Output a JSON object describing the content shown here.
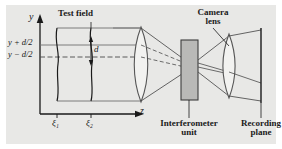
{
  "figure": {
    "kind": "optical-setup-diagram",
    "background_color": "#ffffff",
    "panel_color": "#e8e8e6",
    "ink_color": "#1a1a1a"
  },
  "axes": {
    "y_label": "y",
    "z_label": "z",
    "y_axis_arrow": "up",
    "z_axis_arrow": "right"
  },
  "labels": {
    "test_field": "Test field",
    "camera_lens_line1": "Camera",
    "camera_lens_line2": "lens",
    "interferometer_line1": "Interferometer",
    "interferometer_line2": "unit",
    "recording_line1": "Recording",
    "recording_line2": "plane",
    "y_plus": "y + d/2",
    "y_minus": "y − d/2",
    "separation": "d",
    "xi1": "ξ₁",
    "xi2": "ξ₂"
  },
  "components": [
    {
      "name": "test-field-wavefront-1",
      "type": "wavy-line",
      "z": "ξ₁"
    },
    {
      "name": "test-field-wavefront-2",
      "type": "wavy-line",
      "z": "ξ₂"
    },
    {
      "name": "objective-lens",
      "type": "lens"
    },
    {
      "name": "interferometer-unit",
      "type": "block"
    },
    {
      "name": "camera-lens",
      "type": "lens"
    },
    {
      "name": "recording-plane",
      "type": "plane"
    }
  ],
  "ray_paths": {
    "upper_ray": "solid",
    "lower_ray": "solid",
    "axial_ray": "dashed"
  },
  "colors": {
    "panel": "#e8e8e6",
    "ink": "#1a1a1a",
    "lens_fill": "#f2f2f0",
    "block_fill": "#b9b9b7",
    "ray": "#4a4a4a"
  }
}
